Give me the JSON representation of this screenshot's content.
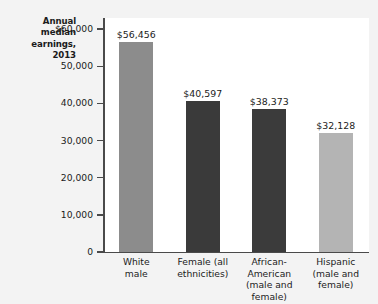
{
  "chart_data": {
    "type": "bar",
    "title": "",
    "subtitle": "",
    "ylabel": "Annual median earnings, 2013",
    "ylabel_lines": [
      "Annual",
      "median",
      "earnings,",
      "2013"
    ],
    "xlabel": "",
    "categories": [
      "White male",
      "Female (all ethnicities)",
      "African-American (male and female)",
      "Hispanic (male and female)"
    ],
    "category_lines": [
      [
        "White",
        "male"
      ],
      [
        "Female (all",
        "ethnicities)"
      ],
      [
        "African-",
        "American",
        "(male and",
        "female)"
      ],
      [
        "Hispanic",
        "(male and",
        "female)"
      ]
    ],
    "values": [
      56456,
      40597,
      38373,
      32128
    ],
    "value_labels": [
      "$56,456",
      "$40,597",
      "$38,373",
      "$32,128"
    ],
    "bar_colors": [
      "#8c8c8c",
      "#3a3a3a",
      "#3b3b3b",
      "#b4b4b4"
    ],
    "ylim": [
      0,
      63000
    ],
    "yticks": [
      0,
      10000,
      20000,
      30000,
      40000,
      50000,
      60000
    ],
    "ytick_labels": [
      "0",
      "10,000",
      "20,000",
      "30,000",
      "40,000",
      "50,000",
      "$60,000"
    ],
    "grid": false,
    "legend": null,
    "axis_color": "#4a4a4a",
    "plot_background": "#ffffff",
    "page_background": "#f3f3f3"
  }
}
